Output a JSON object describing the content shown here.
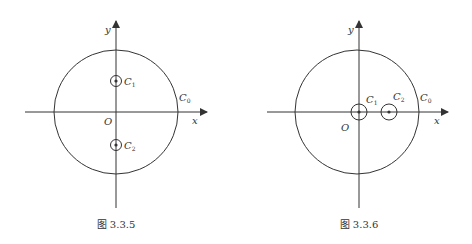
{
  "figures": [
    {
      "caption": "图 3.3.5",
      "axis_x_label": "x",
      "axis_y_label": "y",
      "origin_label": "O",
      "outer_circle": {
        "name": "C",
        "sub": "0"
      },
      "inner_circles": [
        {
          "name": "C",
          "sub": "1",
          "position": "on positive y-axis"
        },
        {
          "name": "C",
          "sub": "2",
          "position": "on negative y-axis"
        }
      ]
    },
    {
      "caption": "图 3.3.6",
      "axis_x_label": "x",
      "axis_y_label": "y",
      "origin_label": "O",
      "outer_circle": {
        "name": "C",
        "sub": "0"
      },
      "inner_circles": [
        {
          "name": "C",
          "sub": "1",
          "position": "centered at origin"
        },
        {
          "name": "C",
          "sub": "2",
          "position": "on positive x-axis"
        }
      ]
    }
  ],
  "colors": {
    "stroke": "#333333",
    "background": "#ffffff"
  }
}
